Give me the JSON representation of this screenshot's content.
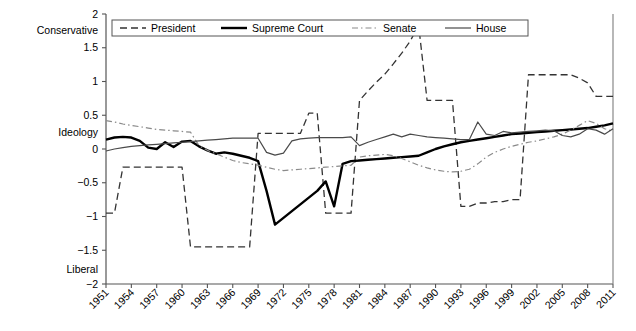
{
  "chart_data": {
    "type": "line",
    "title": "",
    "xlabel": "",
    "ylabel": "Ideology",
    "xlim": [
      1951,
      2011
    ],
    "ylim": [
      -2,
      2
    ],
    "grid": false,
    "legend_position": "top-inside",
    "y_ticks": [
      2,
      1.5,
      1,
      0.5,
      0,
      -0.5,
      -1,
      -1.5,
      -2
    ],
    "y_tick_labels": [
      "2",
      "1.5",
      "1",
      "0.5",
      "0",
      "−0.5",
      "−1",
      "−1.5",
      "−2"
    ],
    "y_axis_top_label": "Conservative",
    "y_axis_mid_label": "Ideology",
    "y_axis_bottom_label": "Liberal",
    "x_ticks": [
      1951,
      1954,
      1957,
      1960,
      1963,
      1966,
      1969,
      1972,
      1975,
      1978,
      1981,
      1984,
      1987,
      1990,
      1993,
      1996,
      1999,
      2002,
      2005,
      2008,
      2011
    ],
    "x_tick_labels": [
      "1951",
      "1954",
      "1957",
      "1960",
      "1963",
      "1966",
      "1969",
      "1972",
      "1975",
      "1978",
      "1981",
      "1984",
      "1987",
      "1990",
      "1993",
      "1996",
      "1999",
      "2002",
      "2005",
      "2008",
      "2011"
    ],
    "x": [
      1951,
      1952,
      1953,
      1954,
      1955,
      1956,
      1957,
      1958,
      1959,
      1960,
      1961,
      1962,
      1963,
      1964,
      1965,
      1966,
      1967,
      1968,
      1969,
      1970,
      1971,
      1972,
      1973,
      1974,
      1975,
      1976,
      1977,
      1978,
      1979,
      1980,
      1981,
      1982,
      1983,
      1984,
      1985,
      1986,
      1987,
      1988,
      1989,
      1990,
      1991,
      1992,
      1993,
      1994,
      1995,
      1996,
      1997,
      1998,
      1999,
      2000,
      2001,
      2002,
      2003,
      2004,
      2005,
      2006,
      2007,
      2008,
      2009,
      2010,
      2011
    ],
    "series": [
      {
        "name": "President",
        "style": "dashed",
        "color": "#000000",
        "values": [
          -0.95,
          -0.95,
          -0.27,
          -0.27,
          -0.27,
          -0.27,
          -0.27,
          -0.27,
          -0.27,
          -0.27,
          -1.45,
          -1.45,
          -1.45,
          -1.45,
          -1.45,
          -1.45,
          -1.45,
          -1.45,
          0.23,
          0.23,
          0.23,
          0.23,
          0.23,
          0.23,
          0.53,
          0.53,
          -0.95,
          -0.95,
          -0.95,
          -0.95,
          0.72,
          0.86,
          0.99,
          1.11,
          1.26,
          1.42,
          1.6,
          1.83,
          0.72,
          0.72,
          0.72,
          0.72,
          -0.85,
          -0.85,
          -0.8,
          -0.8,
          -0.78,
          -0.78,
          -0.75,
          -0.75,
          1.1,
          1.1,
          1.1,
          1.1,
          1.1,
          1.1,
          1.05,
          0.98,
          0.78,
          0.78,
          0.78
        ]
      },
      {
        "name": "Supreme Court",
        "style": "solid-thick",
        "color": "#000000",
        "values": [
          0.14,
          0.17,
          0.18,
          0.17,
          0.12,
          0.02,
          0.0,
          0.1,
          0.03,
          0.11,
          0.12,
          0.04,
          -0.02,
          -0.07,
          -0.05,
          -0.07,
          -0.1,
          -0.13,
          -0.18,
          -0.62,
          -1.12,
          -1.02,
          -0.92,
          -0.82,
          -0.72,
          -0.62,
          -0.48,
          -0.85,
          -0.22,
          -0.18,
          -0.17,
          -0.16,
          -0.15,
          -0.14,
          -0.13,
          -0.12,
          -0.11,
          -0.1,
          -0.05,
          0.0,
          0.04,
          0.07,
          0.1,
          0.12,
          0.14,
          0.16,
          0.18,
          0.2,
          0.22,
          0.23,
          0.24,
          0.25,
          0.26,
          0.27,
          0.28,
          0.29,
          0.3,
          0.31,
          0.33,
          0.35,
          0.38
        ]
      },
      {
        "name": "Senate",
        "style": "dashdot",
        "color": "#808080",
        "values": [
          0.42,
          0.4,
          0.37,
          0.35,
          0.33,
          0.31,
          0.29,
          0.28,
          0.27,
          0.26,
          0.25,
          0.05,
          -0.02,
          -0.07,
          -0.12,
          -0.17,
          -0.2,
          -0.22,
          -0.24,
          -0.27,
          -0.3,
          -0.32,
          -0.31,
          -0.3,
          -0.29,
          -0.28,
          -0.27,
          -0.26,
          -0.25,
          -0.24,
          -0.12,
          -0.1,
          -0.09,
          -0.08,
          -0.1,
          -0.14,
          -0.19,
          -0.24,
          -0.28,
          -0.31,
          -0.33,
          -0.34,
          -0.33,
          -0.3,
          -0.22,
          -0.12,
          -0.05,
          0.0,
          0.04,
          0.07,
          0.1,
          0.12,
          0.15,
          0.18,
          0.22,
          0.28,
          0.35,
          0.42,
          0.38,
          0.3,
          0.26
        ]
      },
      {
        "name": "House",
        "style": "solid-thin",
        "color": "#404040",
        "values": [
          -0.03,
          0.0,
          0.02,
          0.04,
          0.05,
          0.06,
          0.07,
          0.08,
          0.09,
          0.1,
          0.11,
          0.12,
          0.13,
          0.14,
          0.15,
          0.16,
          0.16,
          0.16,
          0.16,
          -0.05,
          -0.09,
          -0.06,
          0.12,
          0.15,
          0.16,
          0.17,
          0.17,
          0.17,
          0.17,
          0.18,
          0.05,
          0.1,
          0.14,
          0.18,
          0.22,
          0.18,
          0.22,
          0.2,
          0.18,
          0.17,
          0.16,
          0.15,
          0.14,
          0.14,
          0.4,
          0.22,
          0.2,
          0.26,
          0.24,
          0.25,
          0.26,
          0.27,
          0.28,
          0.27,
          0.2,
          0.18,
          0.22,
          0.3,
          0.28,
          0.22,
          0.3
        ]
      }
    ]
  },
  "legend": {
    "items": [
      {
        "label": "President",
        "style": "dashed"
      },
      {
        "label": "Supreme Court",
        "style": "solid-thick"
      },
      {
        "label": "Senate",
        "style": "dashdot"
      },
      {
        "label": "House",
        "style": "solid-thin"
      }
    ]
  }
}
